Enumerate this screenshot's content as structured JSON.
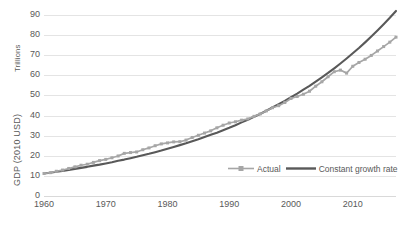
{
  "axes": {
    "y_unit_label": "Trillions",
    "y_axis_title": "GDP (2010 USD)",
    "y_ticks": [
      "90",
      "80",
      "70",
      "60",
      "50",
      "40",
      "30",
      "20",
      "10",
      "0"
    ],
    "x_ticks": [
      "1960",
      "1970",
      "1980",
      "1990",
      "2000",
      "2010"
    ]
  },
  "legend": {
    "entries": [
      {
        "label": "Actual",
        "color": "#a6a6a6",
        "marker": "square"
      },
      {
        "label": "Constant growth rate",
        "color": "#595959",
        "marker": "none"
      }
    ]
  },
  "colors": {
    "actual": "#a6a6a6",
    "constant_growth": "#595959",
    "gridline": "#e4e4e4",
    "axis_text": "#595959",
    "background": "#ffffff"
  },
  "chart_data": {
    "type": "line",
    "title": "",
    "xlabel": "",
    "ylabel": "GDP (2010 USD)",
    "y_unit": "Trillions",
    "xlim": [
      1960,
      2017
    ],
    "ylim": [
      0,
      90
    ],
    "grid": true,
    "legend_position": "inside-bottom-right",
    "x": [
      1960,
      1961,
      1962,
      1963,
      1964,
      1965,
      1966,
      1967,
      1968,
      1969,
      1970,
      1971,
      1972,
      1973,
      1974,
      1975,
      1976,
      1977,
      1978,
      1979,
      1980,
      1981,
      1982,
      1983,
      1984,
      1985,
      1986,
      1987,
      1988,
      1989,
      1990,
      1991,
      1992,
      1993,
      1994,
      1995,
      1996,
      1997,
      1998,
      1999,
      2000,
      2001,
      2002,
      2003,
      2004,
      2005,
      2006,
      2007,
      2008,
      2009,
      2010,
      2011,
      2012,
      2013,
      2014,
      2015,
      2016,
      2017
    ],
    "series": [
      {
        "name": "Actual",
        "color": "#a6a6a6",
        "values": [
          11.2,
          11.6,
          12.3,
          12.9,
          13.7,
          14.5,
          15.3,
          15.8,
          16.7,
          17.6,
          18.2,
          19.0,
          19.9,
          21.2,
          21.6,
          21.9,
          23.0,
          23.9,
          25.0,
          25.9,
          26.4,
          26.9,
          27.0,
          27.8,
          29.1,
          30.2,
          31.3,
          32.4,
          33.9,
          35.2,
          36.3,
          36.9,
          37.7,
          38.3,
          39.6,
          40.8,
          42.3,
          43.9,
          44.9,
          46.5,
          48.5,
          49.5,
          50.6,
          52.1,
          54.6,
          56.8,
          59.3,
          61.8,
          62.6,
          61.1,
          64.5,
          66.4,
          68.0,
          69.9,
          72.1,
          74.3,
          76.5,
          79.0
        ]
      },
      {
        "name": "Constant growth rate",
        "color": "#595959",
        "values": [
          11.2,
          11.6,
          12.1,
          12.5,
          13.0,
          13.5,
          14.0,
          14.5,
          15.1,
          15.6,
          16.2,
          16.8,
          17.5,
          18.1,
          18.8,
          19.5,
          20.3,
          21.0,
          21.8,
          22.6,
          23.5,
          24.4,
          25.3,
          26.2,
          27.2,
          28.2,
          29.3,
          30.4,
          31.5,
          32.7,
          33.9,
          35.2,
          36.6,
          37.9,
          39.4,
          40.8,
          42.4,
          44.0,
          45.6,
          47.3,
          49.1,
          50.9,
          52.9,
          54.8,
          56.9,
          59.0,
          61.2,
          63.5,
          65.9,
          68.4,
          71.0,
          73.6,
          76.4,
          79.3,
          82.3,
          85.4,
          88.6,
          92.0
        ]
      }
    ],
    "note": "Constant growth curve truncated at plot top; both series anchored near 11 in 1960 and ~85 at series end"
  }
}
